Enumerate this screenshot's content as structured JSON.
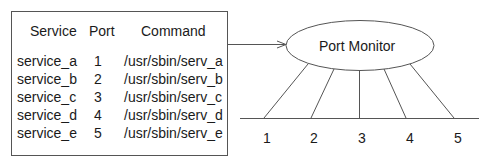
{
  "table": {
    "headers": {
      "service": "Service",
      "port": "Port",
      "command": "Command"
    },
    "rows": [
      {
        "service": "service_a",
        "port": "1",
        "command": "/usr/sbin/serv_a"
      },
      {
        "service": "service_b",
        "port": "2",
        "command": "/usr/sbin/serv_b"
      },
      {
        "service": "service_c",
        "port": "3",
        "command": "/usr/sbin/serv_c"
      },
      {
        "service": "service_d",
        "port": "4",
        "command": "/usr/sbin/serv_d"
      },
      {
        "service": "service_e",
        "port": "5",
        "command": "/usr/sbin/serv_e"
      }
    ]
  },
  "monitor": {
    "label": "Port Monitor"
  },
  "ports": {
    "labels": [
      "1",
      "2",
      "3",
      "4",
      "5"
    ]
  },
  "colors": {
    "stroke": "#555555",
    "text": "#1a1a1a",
    "background": "#ffffff"
  }
}
